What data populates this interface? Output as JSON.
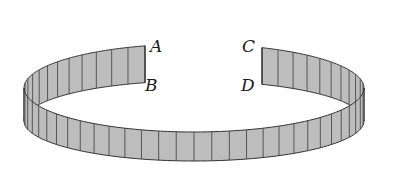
{
  "figure": {
    "labels": {
      "A": "A",
      "B": "B",
      "C": "C",
      "D": "D"
    },
    "colors": {
      "band_fill": "#bdbdbd",
      "stripe": "#4a4a4a",
      "outline": "#333333",
      "background": "#ffffff"
    },
    "geometry": {
      "center_x": 194,
      "upper_center_y": 88,
      "upper_ry": 44,
      "lower_center_y": 121,
      "lower_ry": 40,
      "rx": 170,
      "gap_left_x": 145,
      "gap_right_x": 262,
      "stripe_count": 60
    }
  }
}
